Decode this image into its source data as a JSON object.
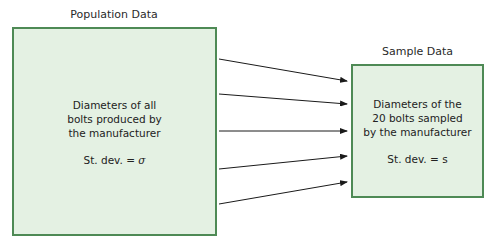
{
  "population": {
    "title": "Population Data",
    "lines": [
      "Diameters of all",
      "bolts produced by",
      "the manufacturer"
    ],
    "stdev_label": "St. dev. = ",
    "stdev_symbol": "σ"
  },
  "sample": {
    "title": "Sample Data",
    "lines": [
      "Diameters of the",
      "20 bolts sampled",
      "by the manufacturer"
    ],
    "stdev_label": "St. dev. = ",
    "stdev_symbol": "s"
  },
  "arrows": {
    "count": 5,
    "color": "#1a1a1a"
  },
  "colors": {
    "box_fill": "#e4f1e3",
    "box_border": "#4e8a55"
  }
}
